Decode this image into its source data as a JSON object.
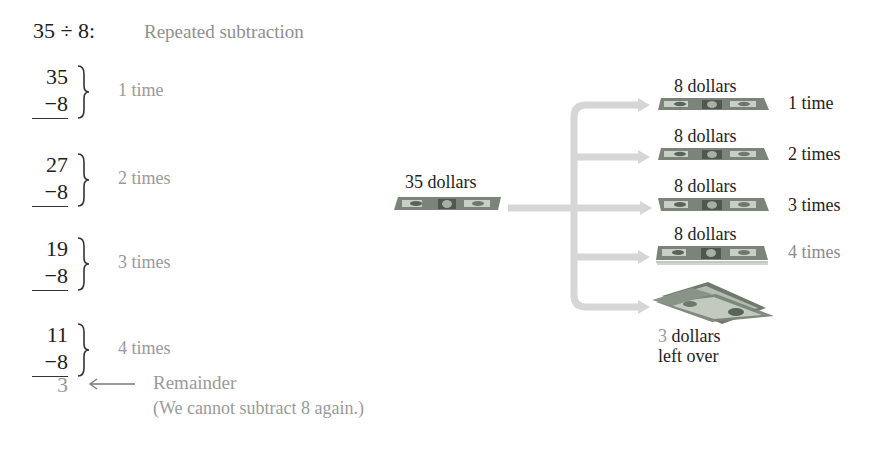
{
  "header": {
    "expression": "35 ÷ 8:",
    "method": "Repeated subtraction"
  },
  "steps": [
    {
      "minuend": "35",
      "subtrahend": "−8",
      "label": "1 time"
    },
    {
      "minuend": "27",
      "subtrahend": "−8",
      "label": "2 times"
    },
    {
      "minuend": "19",
      "subtrahend": "−8",
      "label": "3 times"
    },
    {
      "minuend": "11",
      "subtrahend": "−8",
      "label": "4 times"
    }
  ],
  "remainder": {
    "value": "3",
    "arrow_icon": "left-arrow-icon",
    "label": "Remainder",
    "note": "(We cannot subtract 8 again.)"
  },
  "money_diagram": {
    "source_label": "35 dollars",
    "groups": [
      {
        "amount": "8 dollars",
        "count_label": "1 time"
      },
      {
        "amount": "8 dollars",
        "count_label": "2 times"
      },
      {
        "amount": "8 dollars",
        "count_label": "3 times"
      },
      {
        "amount": "8 dollars",
        "count_label": "4 times"
      }
    ],
    "leftover": {
      "digit": "3",
      "line1_rest": " dollars",
      "line2": "left over"
    },
    "colors": {
      "arrow": "#d6d6d6",
      "bill_base": "#6f7a6c",
      "text_dark": "#1e1e1e",
      "text_gray": "#9a9a9a"
    }
  }
}
